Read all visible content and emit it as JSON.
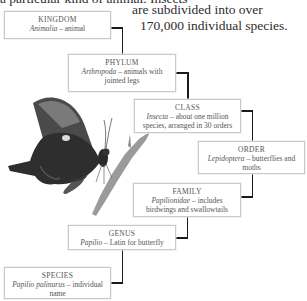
{
  "intro": {
    "top_partial": "a particular kind of animal. Insects",
    "right_line1": "are subdivided into over",
    "right_line2": "170,000 individual species."
  },
  "taxonomy": [
    {
      "rank": "KINGDOM",
      "name": "Animalia",
      "description": "animal"
    },
    {
      "rank": "PHYLUM",
      "name": "Arthropoda",
      "description": "animals with jointed legs"
    },
    {
      "rank": "CLASS",
      "name": "Insecta",
      "description": "about one million species, arranged in 30 orders"
    },
    {
      "rank": "ORDER",
      "name": "Lepidoptera",
      "description": "butterflies and moths"
    },
    {
      "rank": "FAMILY",
      "name": "Papilionidae",
      "description": "includes birdwings and swallowtails"
    },
    {
      "rank": "GENUS",
      "name": "Papilio",
      "description": "Latin for butterfly"
    },
    {
      "rank": "SPECIES",
      "name": "Papilio palinurus",
      "description": "individual name"
    }
  ],
  "separator": " – ",
  "image": {
    "subject": "butterfly-on-stem"
  }
}
